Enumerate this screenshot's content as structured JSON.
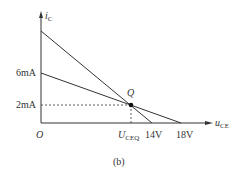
{
  "figure": {
    "caption": "(b)",
    "y_axis_label": "i",
    "y_axis_sub": "C",
    "x_axis_label": "u",
    "x_axis_sub": "CE",
    "origin_label": "O",
    "y_ticks": [
      "6mA",
      "2mA"
    ],
    "x_ticks": {
      "ueq_main": "U",
      "ueq_sub": "CEQ",
      "t14": "14V",
      "t18": "18V"
    },
    "q_label": "Q"
  },
  "colors": {
    "line": "#333333",
    "background": "#ffffff"
  }
}
